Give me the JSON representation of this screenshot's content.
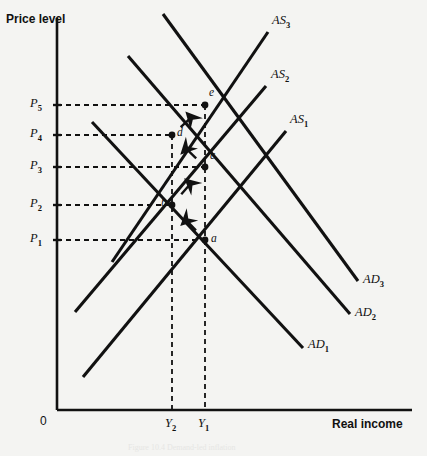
{
  "figure": {
    "background_color": "#f4f4f2",
    "ink_color": "#111111",
    "caption": "Figure 10.4   Demand-led inflation"
  },
  "axes": {
    "y_axis_title": "Price level",
    "x_axis_title": "Real income",
    "origin_label": "0",
    "y_axis_x_px": 57,
    "x_axis_y_px": 410,
    "y_axis_top_px": 18,
    "x_axis_right_px": 412
  },
  "price_ticks": [
    {
      "label": "P",
      "sub": "1",
      "y_px": 240
    },
    {
      "label": "P",
      "sub": "2",
      "y_px": 205
    },
    {
      "label": "P",
      "sub": "3",
      "y_px": 167
    },
    {
      "label": "P",
      "sub": "4",
      "y_px": 135
    },
    {
      "label": "P",
      "sub": "5",
      "y_px": 105
    }
  ],
  "income_ticks": [
    {
      "label": "Y",
      "sub": "2",
      "x_px": 172
    },
    {
      "label": "Y",
      "sub": "1",
      "x_px": 205
    }
  ],
  "curves": {
    "aggregate_supply": [
      {
        "name": "AS",
        "sub": "1",
        "label_x": 290,
        "label_y": 112,
        "x1": 83,
        "y1": 377,
        "x2": 286,
        "y2": 131
      },
      {
        "name": "AS",
        "sub": "2",
        "label_x": 271,
        "label_y": 67,
        "x1": 75,
        "y1": 312,
        "x2": 266,
        "y2": 86
      },
      {
        "name": "AS",
        "sub": "3",
        "label_x": 272,
        "label_y": 13,
        "x1": 112,
        "y1": 262,
        "x2": 268,
        "y2": 32
      }
    ],
    "aggregate_demand": [
      {
        "name": "AD",
        "sub": "1",
        "label_x": 308,
        "label_y": 337,
        "x1": 92,
        "y1": 122,
        "x2": 303,
        "y2": 348
      },
      {
        "name": "AD",
        "sub": "2",
        "label_x": 355,
        "label_y": 305,
        "x1": 128,
        "y1": 56,
        "x2": 350,
        "y2": 314
      },
      {
        "name": "AD",
        "sub": "3",
        "label_x": 363,
        "label_y": 272,
        "x1": 163,
        "y1": 14,
        "x2": 358,
        "y2": 281
      }
    ]
  },
  "equilibrium_points": [
    {
      "label": "a",
      "x_px": 205,
      "y_px": 240,
      "label_dx": 6,
      "label_dy": -2
    },
    {
      "label": "b",
      "x_px": 172,
      "y_px": 205,
      "label_dx": -11,
      "label_dy": -3
    },
    {
      "label": "c",
      "x_px": 205,
      "y_px": 167,
      "label_dx": 5,
      "label_dy": -12
    },
    {
      "label": "d",
      "x_px": 172,
      "y_px": 135,
      "label_dx": 5,
      "label_dy": -3
    },
    {
      "label": "e",
      "x_px": 205,
      "y_px": 105,
      "label_dx": 4,
      "label_dy": -13
    }
  ],
  "adjustment_path": {
    "description": "a to b to c to d to e",
    "segments": [
      {
        "from": "a",
        "to": "b"
      },
      {
        "from": "b",
        "to": "c"
      },
      {
        "from": "c",
        "to": "d"
      },
      {
        "from": "d",
        "to": "e"
      }
    ]
  }
}
